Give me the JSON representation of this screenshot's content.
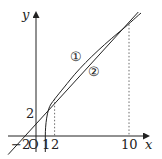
{
  "diagram": {
    "axes": {
      "x_label": "x",
      "y_label": "y",
      "origin_label": "O"
    },
    "tick_labels": {
      "x_neg2": "−2",
      "x_1": "1",
      "x_2": "2",
      "x_10": "10",
      "y_2": "2"
    },
    "curves": [
      {
        "id": "curve-1",
        "marker": "①",
        "description": "parabola y^2 = 16(x-1), starting at (1,0)"
      },
      {
        "id": "line-2",
        "marker": "②",
        "description": "line y = x + 2 through (-2,0) and (0,2)"
      }
    ],
    "intersections": [
      {
        "x": 2,
        "y": 4
      },
      {
        "x": 10,
        "y": 12
      }
    ],
    "colors": {
      "stroke": "#222222",
      "background": "#ffffff"
    }
  }
}
